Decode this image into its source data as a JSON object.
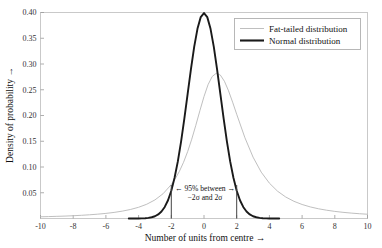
{
  "chart_data": {
    "type": "line",
    "title": "",
    "xlabel": "Number of units from centre →",
    "ylabel": "Density of probability →",
    "xlim": [
      -10,
      10
    ],
    "ylim": [
      0,
      0.4
    ],
    "grid": false,
    "xticks": [
      -10,
      -8,
      -6,
      -4,
      -2,
      0,
      2,
      4,
      6,
      8,
      10
    ],
    "xtick_labels": [
      "-10",
      "-8",
      "-6",
      "-4",
      "-2",
      "0",
      "2",
      "4",
      "6",
      "8",
      "10"
    ],
    "yticks": [
      0.05,
      0.1,
      0.15,
      0.2,
      0.25,
      0.3,
      0.35,
      0.4
    ],
    "ytick_labels": [
      "0.05",
      "0.10",
      "0.15",
      "0.20",
      "0.25",
      "0.30",
      "0.35",
      "0.40"
    ],
    "legend_position": "top-right",
    "series": [
      {
        "name": "Fat-tailed distribution",
        "color": "#b8b8b8",
        "style": "thin",
        "peak": 0.33,
        "x": [
          -10,
          -9.5,
          -9,
          -8.5,
          -8,
          -7.5,
          -7,
          -6.5,
          -6,
          -5.5,
          -5,
          -4.5,
          -4,
          -3.5,
          -3,
          -2.5,
          -2,
          -1.75,
          -1.5,
          -1.25,
          -1,
          -0.75,
          -0.5,
          -0.25,
          0,
          0.25,
          0.5,
          0.75,
          1,
          1.25,
          1.5,
          1.75,
          2,
          2.5,
          3,
          3.5,
          4,
          4.5,
          5,
          5.5,
          6,
          6.5,
          7,
          7.5,
          8,
          8.5,
          9,
          9.5,
          10
        ],
        "values": [
          0.0033,
          0.0037,
          0.0042,
          0.0047,
          0.0054,
          0.0062,
          0.0072,
          0.0084,
          0.0099,
          0.0118,
          0.0143,
          0.0175,
          0.0218,
          0.0277,
          0.0361,
          0.0482,
          0.0659,
          0.0776,
          0.0919,
          0.1092,
          0.1299,
          0.154,
          0.181,
          0.2095,
          0.2369,
          0.26,
          0.2757,
          0.282,
          0.2785,
          0.2664,
          0.248,
          0.2259,
          0.2024,
          0.157,
          0.1192,
          0.09,
          0.0686,
          0.053,
          0.0417,
          0.0334,
          0.0272,
          0.0225,
          0.0189,
          0.0161,
          0.0138,
          0.012,
          0.0105,
          0.0093,
          0.0083
        ]
      },
      {
        "name": "Normal distribution",
        "color": "#1a1a1a",
        "style": "thick",
        "peak": 0.3989,
        "x": [
          -4.6,
          -4.4,
          -4.2,
          -4,
          -3.8,
          -3.6,
          -3.4,
          -3.2,
          -3,
          -2.8,
          -2.6,
          -2.4,
          -2.2,
          -2,
          -1.8,
          -1.6,
          -1.4,
          -1.2,
          -1,
          -0.8,
          -0.6,
          -0.4,
          -0.2,
          0,
          0.2,
          0.4,
          0.6,
          0.8,
          1,
          1.2,
          1.4,
          1.6,
          1.8,
          2,
          2.2,
          2.4,
          2.6,
          2.8,
          3,
          3.2,
          3.4,
          3.6,
          3.8,
          4,
          4.2,
          4.4,
          4.6
        ],
        "values": [
          0.0,
          0.0001,
          0.0001,
          0.0001,
          0.0003,
          0.0006,
          0.0012,
          0.0024,
          0.0044,
          0.0079,
          0.0136,
          0.0224,
          0.0355,
          0.054,
          0.079,
          0.1109,
          0.1497,
          0.1942,
          0.242,
          0.2897,
          0.3332,
          0.3683,
          0.391,
          0.3989,
          0.391,
          0.3683,
          0.3332,
          0.2897,
          0.242,
          0.1942,
          0.1497,
          0.1109,
          0.079,
          0.054,
          0.0355,
          0.0224,
          0.0136,
          0.0079,
          0.0044,
          0.0024,
          0.0012,
          0.0006,
          0.0003,
          0.0001,
          0.0001,
          0.0001,
          0.0
        ]
      }
    ],
    "annotations": [
      {
        "name": "ci-annotation-line1",
        "text": "← 95% between →",
        "x": 0,
        "y": 0.0545
      },
      {
        "name": "ci-annotation-line2",
        "text": "−2σ and 2σ",
        "x": 0,
        "y": 0.0395
      }
    ],
    "vertical_markers": [
      {
        "name": "sigma-marker-negative",
        "x": -2,
        "y_top": 0.065
      },
      {
        "name": "sigma-marker-positive",
        "x": 2,
        "y_top": 0.065
      }
    ]
  }
}
